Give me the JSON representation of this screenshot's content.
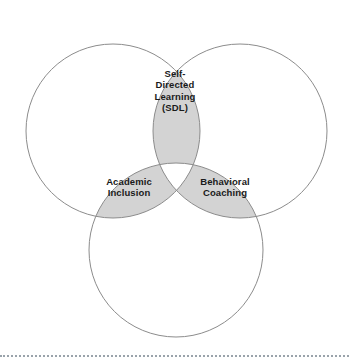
{
  "diagram": {
    "type": "venn",
    "set_count": 3,
    "background_color": "#ffffff",
    "circle_stroke_color": "#8c8c8c",
    "overlap_fill_color": "#d3d3d3",
    "overlap_stroke_color": "#8c8c8c",
    "label_color": "#1a1a1a",
    "circles": [
      {
        "name": "top-left-circle",
        "cx": 113,
        "cy": 131,
        "r": 87
      },
      {
        "name": "top-right-circle",
        "cx": 240,
        "cy": 131,
        "r": 87
      },
      {
        "name": "bottom-circle",
        "cx": 176,
        "cy": 250,
        "r": 87
      }
    ],
    "overlaps": [
      {
        "name": "top-lens",
        "label": "Self-\nDirected\nLearning\n(SDL)"
      },
      {
        "name": "lower-left-lens",
        "label": "Academic\nInclusion"
      },
      {
        "name": "lower-right-lens",
        "label": "Behavioral\nCoaching"
      }
    ],
    "center_region": {
      "name": "triple-intersection",
      "filled": false
    },
    "divider": {
      "name": "bottom-dotted-rule",
      "style": "dotted",
      "color": "#9aa3ab"
    }
  }
}
